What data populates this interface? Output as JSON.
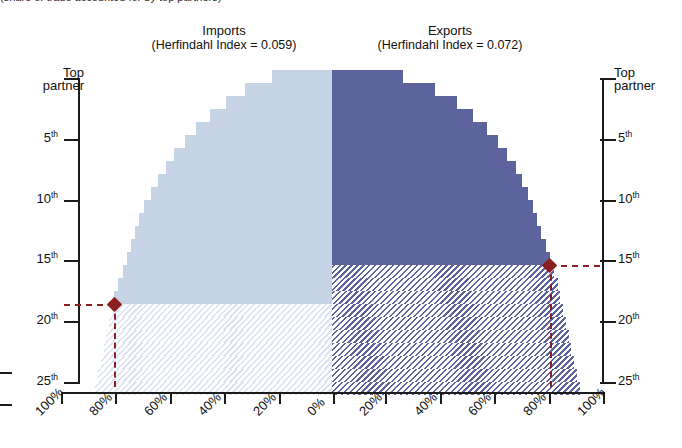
{
  "caption": {
    "clipped_top_text": "(share of trade accounted for by top partners)"
  },
  "panels": {
    "imports": {
      "name": "Imports",
      "index_label": "(Herfindahl Index = 0.059)",
      "herfindahl_index": 0.059,
      "color": "#c7d4e5",
      "hatch_color": "#dbe4f0"
    },
    "exports": {
      "name": "Exports",
      "index_label": "(Herfindahl Index = 0.072)",
      "herfindahl_index": 0.072,
      "color": "#5d639c",
      "hatch_color": "#5d639c"
    }
  },
  "axes": {
    "y_left": {
      "title_line1": "Top",
      "title_line2": "partner",
      "ticks": [
        "5",
        "10",
        "15",
        "20",
        "25"
      ],
      "suffix": "th"
    },
    "y_right": {
      "title_line1": "Top",
      "title_line2": "partner",
      "ticks": [
        "5",
        "10",
        "15",
        "20",
        "25"
      ],
      "suffix": "th"
    },
    "x_left": [
      "100%",
      "80%",
      "60%",
      "40%",
      "20%",
      "0%"
    ],
    "x_right": [
      "0%",
      "20%",
      "40%",
      "60%",
      "80%",
      "100%"
    ],
    "edge_fragment_label": "0"
  },
  "markers": {
    "accent_color": "#8c2020",
    "imports": {
      "rank": 18,
      "rank_label": "18th",
      "share": "80%"
    },
    "exports": {
      "rank": 15,
      "rank_label": "15th",
      "share": "80%"
    }
  },
  "chart_data": {
    "type": "area",
    "subtitle": "(share of trade accounted for by top partners)",
    "orientation": "back-to-back horizontal stepped area (tornado)",
    "xlabel": "",
    "ylabel": "Partner rank",
    "xlim": [
      100,
      0
    ],
    "ylim": [
      1,
      25
    ],
    "grid": false,
    "legend": "none",
    "y_categories": [
      "Top partner",
      "2nd",
      "3rd",
      "4th",
      "5th",
      "6th",
      "7th",
      "8th",
      "9th",
      "10th",
      "11th",
      "12th",
      "13th",
      "14th",
      "15th",
      "16th",
      "17th",
      "18th",
      "19th",
      "20th",
      "21st",
      "22nd",
      "23rd",
      "24th",
      "25th"
    ],
    "series": [
      {
        "name": "Imports",
        "direction": "left",
        "herfindahl_index": 0.059,
        "color": "#c7d4e5",
        "cumulative_share_pct": [
          22,
          32,
          39,
          45,
          50,
          54,
          58,
          61,
          64,
          66.5,
          69,
          71,
          72.5,
          74,
          75.5,
          77,
          78.5,
          80,
          81,
          82,
          83,
          84,
          85,
          86,
          87
        ],
        "solid_above_rank": 18,
        "hatched_below_rank": 18
      },
      {
        "name": "Exports",
        "direction": "right",
        "herfindahl_index": 0.072,
        "color": "#5d639c",
        "cumulative_share_pct": [
          26,
          38,
          46,
          52,
          57,
          61,
          64.5,
          67.5,
          70,
          72,
          74,
          75.5,
          77,
          78.5,
          80,
          81.5,
          83,
          84,
          85,
          86,
          87,
          88,
          89,
          90,
          91
        ],
        "solid_above_rank": 15,
        "hatched_below_rank": 15
      }
    ],
    "annotations": [
      {
        "label": "Imports 80% threshold",
        "rank": 18,
        "share_pct": 80,
        "marker": "diamond",
        "color": "#8c2020"
      },
      {
        "label": "Exports 80% threshold",
        "rank": 15,
        "share_pct": 80,
        "marker": "diamond",
        "color": "#8c2020"
      }
    ]
  }
}
